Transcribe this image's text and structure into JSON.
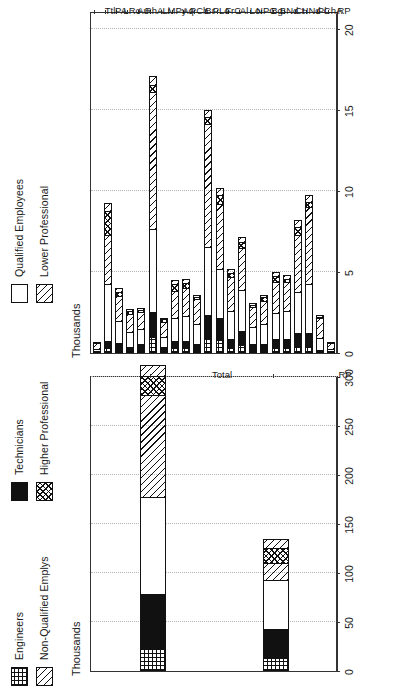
{
  "legend": {
    "entries": [
      {
        "label": "Engineers",
        "pattern": "grid"
      },
      {
        "label": "Technicians",
        "pattern": "black"
      },
      {
        "label": "Qualified Employees",
        "pattern": "white"
      },
      {
        "label": "Non-Qualified Emplys",
        "pattern": "diag"
      },
      {
        "label": "Higher Professional",
        "pattern": "cross"
      },
      {
        "label": "Lower Professional",
        "pattern": "diag"
      }
    ]
  },
  "chart_data": [
    {
      "id": "left",
      "type": "bar",
      "orientation": "horizontal",
      "title": "",
      "xlabel": "Thousands",
      "ylabel": "",
      "axis_label": "Thousands",
      "categories": [
        "RP",
        "Total"
      ],
      "ticks": [
        0,
        50,
        100,
        150,
        200,
        250,
        300
      ],
      "xlim": [
        0,
        300
      ],
      "grid": true,
      "legend_position": "top",
      "stacked": true,
      "series": [
        {
          "name": "Engineers",
          "pattern": "grid",
          "values": [
            13,
            22
          ]
        },
        {
          "name": "Technicians",
          "pattern": "black",
          "values": [
            31,
            58
          ]
        },
        {
          "name": "Qualified Employees",
          "pattern": "white",
          "values": [
            51,
            100
          ]
        },
        {
          "name": "Non-Qualified Emplys",
          "pattern": "diag",
          "values": [
            18,
            105
          ]
        },
        {
          "name": "Higher Professional",
          "pattern": "cross",
          "values": [
            17,
            20
          ]
        },
        {
          "name": "Lower Professional",
          "pattern": "diag",
          "values": [
            10,
            12
          ]
        }
      ],
      "totals": [
        140,
        317
      ]
    },
    {
      "id": "right",
      "type": "bar",
      "orientation": "horizontal",
      "title": "",
      "xlabel": "Thousands",
      "ylabel": "",
      "axis_label": "Thousands",
      "categories": [
        "RP",
        "ChA",
        "Pl",
        "HNd",
        "Ct",
        "BNd",
        "Bg",
        "NPC",
        "Lo",
        "Al",
        "FrC",
        "PLo",
        "Br",
        "PCh",
        "Aq",
        "MPy",
        "Li",
        "RhA",
        "Au",
        "LRo",
        "PA",
        "Ttl"
      ],
      "ticks": [
        0,
        5,
        10,
        15,
        20
      ],
      "xlim": [
        0,
        21
      ],
      "grid": true,
      "legend_position": "top",
      "stacked": true,
      "series": [
        {
          "name": "Engineers",
          "pattern": "grid",
          "values": [
            0.0,
            0.0,
            0.4,
            0.4,
            0.3,
            0.3,
            0.2,
            0.2,
            0.5,
            0.3,
            0.8,
            0.9,
            0.2,
            0.3,
            0.3,
            0.1,
            1.0,
            0.2,
            0.1,
            0.2,
            0.3,
            0.0
          ]
        },
        {
          "name": "Technicians",
          "pattern": "black",
          "values": [
            0.1,
            0.2,
            0.9,
            0.9,
            0.6,
            0.6,
            0.4,
            0.4,
            0.9,
            0.6,
            1.4,
            1.5,
            0.4,
            0.5,
            0.5,
            0.3,
            1.6,
            0.4,
            0.3,
            0.5,
            0.5,
            0.1
          ]
        },
        {
          "name": "Qualified Employees",
          "pattern": "white",
          "values": [
            0.2,
            0.8,
            3.1,
            2.6,
            1.8,
            1.7,
            1.3,
            1.1,
            2.6,
            1.8,
            3.1,
            4.3,
            1.3,
            1.6,
            1.5,
            0.7,
            5.2,
            1.0,
            1.0,
            1.4,
            3.6,
            0.2
          ]
        },
        {
          "name": "Non-Qualified Emplys",
          "pattern": "diag",
          "values": [
            0.4,
            1.3,
            4.8,
            3.6,
            1.9,
            2.0,
            1.5,
            1.3,
            2.7,
            2.2,
            4.1,
            7.6,
            1.6,
            1.8,
            1.7,
            1.0,
            8.5,
            1.1,
            1.2,
            1.6,
            3.1,
            0.4
          ]
        },
        {
          "name": "Higher Professional",
          "pattern": "cross",
          "values": [
            0.0,
            0.1,
            0.4,
            0.5,
            0.2,
            0.4,
            0.3,
            0.2,
            0.4,
            0.3,
            0.6,
            0.5,
            0.2,
            0.4,
            0.5,
            0.2,
            0.5,
            0.2,
            0.2,
            0.3,
            1.5,
            0.0
          ]
        },
        {
          "name": "Lower Professional",
          "pattern": "diag",
          "values": [
            0.1,
            0.2,
            0.5,
            0.5,
            0.3,
            0.3,
            0.2,
            0.2,
            0.4,
            0.3,
            0.5,
            0.5,
            0.2,
            0.3,
            0.3,
            0.1,
            0.6,
            0.2,
            0.2,
            0.3,
            0.6,
            0.1
          ]
        }
      ],
      "totals": [
        0.8,
        2.6,
        10.1,
        8.5,
        5.1,
        5.3,
        3.9,
        3.4,
        7.5,
        5.5,
        10.5,
        15.3,
        3.9,
        4.9,
        4.8,
        2.4,
        17.4,
        3.1,
        3.0,
        4.3,
        9.6,
        0.8
      ]
    }
  ]
}
